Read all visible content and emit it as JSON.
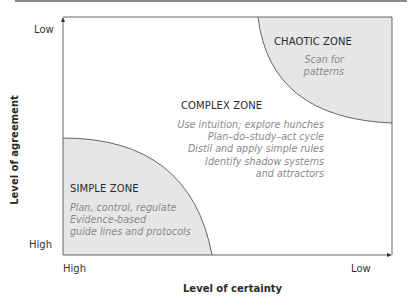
{
  "diagram": {
    "type": "stacey-matrix",
    "x_axis": {
      "label": "Level of certainty",
      "start": "High",
      "end": "Low"
    },
    "y_axis": {
      "label": "Level of agreement",
      "start": "High",
      "end": "Low"
    },
    "zones": {
      "simple": {
        "title": "SIMPLE ZONE",
        "lines": [
          "Plan, control, regulate",
          "Evidence-based",
          "guide lines and protocols"
        ]
      },
      "complex": {
        "title": "COMPLEX ZONE",
        "lines": [
          "Use intuition; explore hunches",
          "Plan–do–study–act cycle",
          "Distil and apply simple rules",
          "Identify shadow systems",
          "and attractors"
        ]
      },
      "chaotic": {
        "title": "CHAOTIC ZONE",
        "lines": [
          "Scan for",
          "patterns"
        ]
      }
    },
    "colors": {
      "zone_fill": "#e6e6e6",
      "line": "#555555",
      "desc_text": "#8a8a8a"
    }
  }
}
